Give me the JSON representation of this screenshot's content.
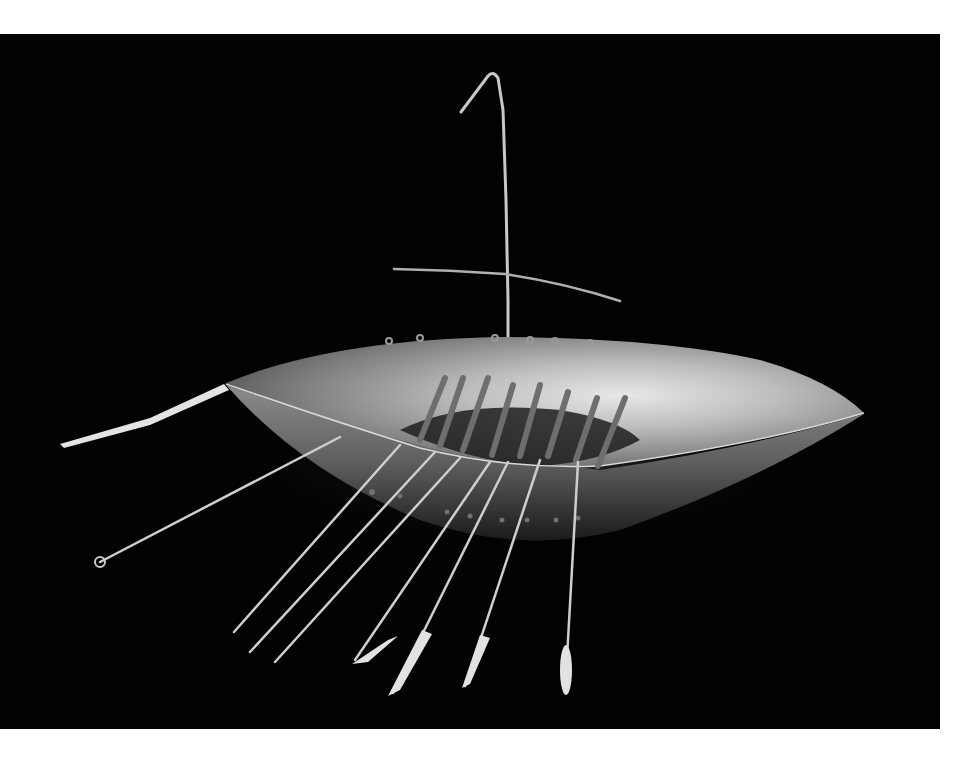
{
  "image": {
    "subject": "Gold boat model with mast, yard, and oars on a black background",
    "alt": "Photograph of a small hammered gold boat model with a hooked mast, crossbar yard, rowing benches, and a row of thin oars, isolated on black",
    "background_color": "#020202",
    "page_color": "#ffffff",
    "metal_highlight_color": "#e6e6e6",
    "metal_mid_color": "#9a9a9a",
    "metal_shadow_color": "#3a3a3a"
  }
}
